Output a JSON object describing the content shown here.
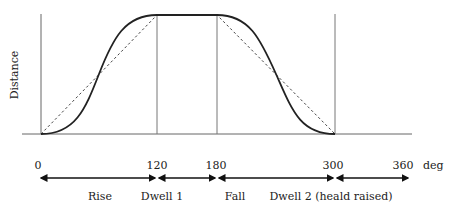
{
  "diagram": {
    "type": "cam displacement diagram",
    "y_axis_label": "Distance",
    "x_unit": "deg",
    "ticks": [
      {
        "value": "0",
        "x": 41
      },
      {
        "value": "120",
        "x": 157
      },
      {
        "value": "180",
        "x": 217
      },
      {
        "value": "300",
        "x": 335
      },
      {
        "value": "360",
        "x": 406
      }
    ],
    "phases": [
      {
        "label": "Rise",
        "from": 0,
        "to": 120
      },
      {
        "label": "Dwell 1",
        "from": 120,
        "to": 180
      },
      {
        "label": "Fall",
        "from": 180,
        "to": 300
      },
      {
        "label": "Dwell 2 (heald raised)",
        "from": 300,
        "to": 360
      }
    ],
    "curves": [
      {
        "name": "smooth displacement (solid)",
        "style": "solid"
      },
      {
        "name": "linear displacement (dashed)",
        "style": "dashed"
      }
    ],
    "colors": {
      "line": "#222222",
      "axis": "#555555",
      "dashed": "#444444"
    }
  }
}
